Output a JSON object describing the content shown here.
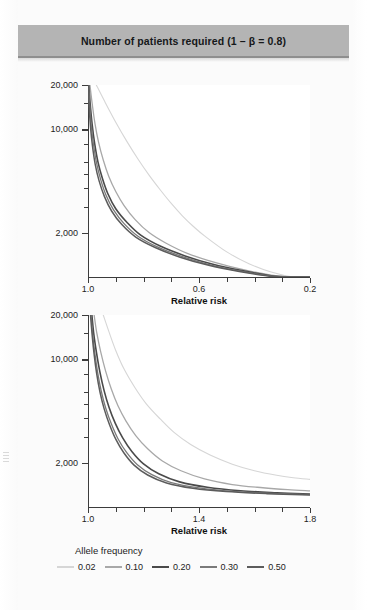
{
  "figure": {
    "title": "Number of patients required (1 – β = 0.8)"
  },
  "legend": {
    "title": "Allele frequency",
    "items": [
      {
        "label": "0.02",
        "color": "#d6d6d6",
        "width": 1.1
      },
      {
        "label": "0.10",
        "color": "#a8a8a8",
        "width": 1.3
      },
      {
        "label": "0.20",
        "color": "#4a4a4a",
        "width": 1.6
      },
      {
        "label": "0.30",
        "color": "#7a7a7a",
        "width": 1.3
      },
      {
        "label": "0.50",
        "color": "#5c5c5c",
        "width": 1.5
      }
    ]
  },
  "chart_data": [
    {
      "type": "line",
      "title": "Number of patients required (1 – β = 0.8)",
      "panel": "top",
      "xlabel": "Relative risk",
      "ylabel": "",
      "xlim": [
        1.0,
        0.2
      ],
      "x_reversed": true,
      "xticks": [
        1.0,
        0.6,
        0.2
      ],
      "xticklabels": [
        "1.0",
        "0.6",
        "0.2"
      ],
      "x_minor_ticks": [
        0.9,
        0.8,
        0.7,
        0.5,
        0.4,
        0.3
      ],
      "ylim": [
        1000,
        20000
      ],
      "yscale": "log",
      "yticks": [
        2000,
        10000,
        20000
      ],
      "yticklabels": [
        "2,000",
        "10,000",
        "20,000"
      ],
      "y_minor_ticks": [
        3000,
        4000,
        5000,
        6000,
        8000,
        15000
      ],
      "grid": false,
      "legend_position": "bottom",
      "series": [
        {
          "name": "0.02",
          "color": "#d6d6d6",
          "x": [
            0.97,
            0.94,
            0.9,
            0.86,
            0.82,
            0.78,
            0.74,
            0.7,
            0.66,
            0.62,
            0.58,
            0.5,
            0.42,
            0.34,
            0.26,
            0.2
          ],
          "y": [
            20000,
            15500,
            11200,
            8300,
            6300,
            4900,
            3900,
            3150,
            2600,
            2200,
            1900,
            1480,
            1230,
            1080,
            1000,
            960
          ]
        },
        {
          "name": "0.10",
          "color": "#a8a8a8",
          "x": [
            0.993,
            0.985,
            0.975,
            0.962,
            0.945,
            0.925,
            0.9,
            0.87,
            0.83,
            0.78,
            0.72,
            0.64,
            0.54,
            0.44,
            0.34,
            0.26,
            0.2
          ],
          "y": [
            20000,
            15000,
            11000,
            8200,
            6200,
            4800,
            3800,
            3050,
            2450,
            2000,
            1700,
            1440,
            1250,
            1120,
            1030,
            980,
            950
          ]
        },
        {
          "name": "0.20",
          "color": "#4a4a4a",
          "x": [
            0.997,
            0.992,
            0.985,
            0.976,
            0.964,
            0.948,
            0.928,
            0.9,
            0.86,
            0.81,
            0.74,
            0.65,
            0.55,
            0.44,
            0.34,
            0.26,
            0.2
          ],
          "y": [
            20000,
            14800,
            10800,
            8000,
            6000,
            4650,
            3650,
            2900,
            2350,
            1920,
            1620,
            1390,
            1220,
            1100,
            1020,
            975,
            945
          ]
        },
        {
          "name": "0.30",
          "color": "#7a7a7a",
          "x": [
            0.998,
            0.994,
            0.988,
            0.98,
            0.969,
            0.954,
            0.935,
            0.908,
            0.87,
            0.82,
            0.75,
            0.66,
            0.56,
            0.45,
            0.34,
            0.26,
            0.2
          ],
          "y": [
            20000,
            14600,
            10600,
            7900,
            5900,
            4550,
            3580,
            2850,
            2300,
            1890,
            1600,
            1375,
            1210,
            1095,
            1015,
            972,
            943
          ]
        },
        {
          "name": "0.50",
          "color": "#5c5c5c",
          "x": [
            0.999,
            0.996,
            0.991,
            0.984,
            0.974,
            0.96,
            0.941,
            0.915,
            0.878,
            0.828,
            0.758,
            0.668,
            0.565,
            0.455,
            0.345,
            0.262,
            0.2
          ],
          "y": [
            20000,
            14400,
            10400,
            7750,
            5800,
            4480,
            3520,
            2800,
            2265,
            1865,
            1585,
            1362,
            1200,
            1090,
            1012,
            970,
            941
          ]
        }
      ]
    },
    {
      "type": "line",
      "panel": "bottom",
      "xlabel": "Relative risk",
      "ylabel": "",
      "xlim": [
        1.0,
        1.8
      ],
      "x_reversed": false,
      "xticks": [
        1.0,
        1.4,
        1.8
      ],
      "xticklabels": [
        "1.0",
        "1.4",
        "1.8"
      ],
      "x_minor_ticks": [
        1.1,
        1.2,
        1.3,
        1.5,
        1.6,
        1.7
      ],
      "ylim": [
        1000,
        20000
      ],
      "yscale": "log",
      "yticks": [
        2000,
        10000,
        20000
      ],
      "yticklabels": [
        "2,000",
        "10,000",
        "20,000"
      ],
      "y_minor_ticks": [
        3000,
        4000,
        5000,
        6000,
        8000,
        15000
      ],
      "grid": false,
      "legend_position": "bottom",
      "series": [
        {
          "name": "0.02",
          "color": "#d6d6d6",
          "x": [
            1.055,
            1.075,
            1.1,
            1.13,
            1.17,
            1.21,
            1.26,
            1.31,
            1.37,
            1.44,
            1.52,
            1.6,
            1.68,
            1.74,
            1.8
          ],
          "y": [
            20000,
            15500,
            11500,
            8600,
            6400,
            5000,
            3950,
            3200,
            2650,
            2250,
            1950,
            1760,
            1640,
            1580,
            1540
          ]
        },
        {
          "name": "0.10",
          "color": "#a8a8a8",
          "x": [
            1.022,
            1.032,
            1.046,
            1.063,
            1.084,
            1.108,
            1.137,
            1.172,
            1.215,
            1.268,
            1.335,
            1.42,
            1.52,
            1.63,
            1.72,
            1.8
          ],
          "y": [
            20000,
            15000,
            11200,
            8400,
            6300,
            4850,
            3820,
            3050,
            2480,
            2050,
            1760,
            1550,
            1420,
            1350,
            1310,
            1285
          ]
        },
        {
          "name": "0.20",
          "color": "#4a4a4a",
          "x": [
            1.014,
            1.021,
            1.031,
            1.043,
            1.058,
            1.076,
            1.098,
            1.125,
            1.158,
            1.2,
            1.255,
            1.33,
            1.43,
            1.55,
            1.68,
            1.8
          ],
          "y": [
            20000,
            14800,
            11000,
            8200,
            6150,
            4720,
            3700,
            2940,
            2380,
            1960,
            1680,
            1480,
            1360,
            1288,
            1248,
            1222
          ]
        },
        {
          "name": "0.30",
          "color": "#7a7a7a",
          "x": [
            1.011,
            1.017,
            1.025,
            1.035,
            1.048,
            1.064,
            1.084,
            1.108,
            1.139,
            1.178,
            1.23,
            1.3,
            1.4,
            1.52,
            1.66,
            1.8
          ],
          "y": [
            20000,
            14700,
            10900,
            8120,
            6080,
            4670,
            3660,
            2900,
            2345,
            1935,
            1658,
            1465,
            1348,
            1278,
            1238,
            1212
          ]
        },
        {
          "name": "0.50",
          "color": "#5c5c5c",
          "x": [
            1.009,
            1.015,
            1.022,
            1.031,
            1.043,
            1.058,
            1.077,
            1.1,
            1.129,
            1.166,
            1.215,
            1.283,
            1.378,
            1.498,
            1.645,
            1.8
          ],
          "y": [
            20000,
            14600,
            10850,
            8080,
            6040,
            4640,
            3635,
            2880,
            2330,
            1922,
            1648,
            1456,
            1340,
            1272,
            1232,
            1206
          ]
        }
      ]
    }
  ]
}
